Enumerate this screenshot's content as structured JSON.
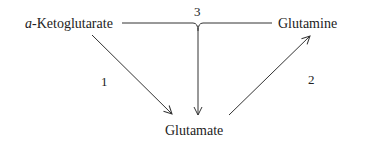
{
  "diagram": {
    "type": "metabolic-pathway",
    "nodes": [
      {
        "id": "akg",
        "prefix": "a",
        "label": "-Ketoglutarate"
      },
      {
        "id": "glutamine",
        "label": "Glutamine"
      },
      {
        "id": "glutamate",
        "label": "Glutamate"
      }
    ],
    "edges": [
      {
        "from": "akg",
        "to": "glutamate",
        "label": "1"
      },
      {
        "from": "glutamate",
        "to": "glutamine",
        "label": "2"
      },
      {
        "from": [
          "akg",
          "glutamine"
        ],
        "to": "glutamate",
        "label": "3"
      }
    ],
    "colors": {
      "line": "#333333",
      "text": "#222222",
      "background": "#ffffff"
    }
  }
}
